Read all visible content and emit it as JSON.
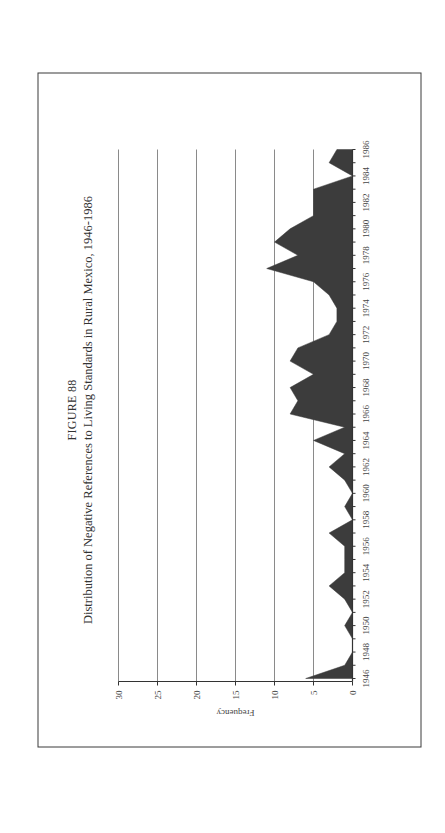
{
  "figure": {
    "number_label": "FIGURE 88",
    "title": "Distribution of Negative References to Living Standards in Rural Mexico, 1946-1986"
  },
  "chart_data": {
    "type": "area",
    "title": "Distribution of Negative References to Living Standards in Rural Mexico, 1946-1986",
    "figure_label": "FIGURE 88",
    "xlabel": "",
    "ylabel": "Frequency",
    "ylim": [
      0,
      30
    ],
    "yticks": [
      0,
      5,
      10,
      15,
      20,
      25,
      30
    ],
    "grid": true,
    "legend": "none",
    "x": [
      1946,
      1947,
      1948,
      1949,
      1950,
      1951,
      1952,
      1953,
      1954,
      1955,
      1956,
      1957,
      1958,
      1959,
      1960,
      1961,
      1962,
      1963,
      1964,
      1965,
      1966,
      1967,
      1968,
      1969,
      1970,
      1971,
      1972,
      1973,
      1974,
      1975,
      1976,
      1977,
      1978,
      1979,
      1980,
      1981,
      1982,
      1983,
      1984,
      1985,
      1986
    ],
    "xtick_labels": [
      "1946",
      "1948",
      "1950",
      "1952",
      "1954",
      "1956",
      "1958",
      "1960",
      "1962",
      "1964",
      "1966",
      "1968",
      "1970",
      "1972",
      "1974",
      "1976",
      "1978",
      "1980",
      "1982",
      "1984",
      "1986"
    ],
    "values": [
      6,
      1,
      0,
      0,
      1,
      0,
      1,
      3,
      1,
      1,
      1,
      3,
      0,
      1,
      0,
      1,
      3,
      1,
      5,
      1,
      8,
      7,
      8,
      5,
      8,
      7,
      3,
      2,
      2,
      3,
      5,
      11,
      7,
      10,
      8,
      5,
      5,
      5,
      0,
      3,
      2
    ],
    "fill_color": "#3c3c3c",
    "orientation": "page rotated 90 degrees counter-clockwise"
  }
}
